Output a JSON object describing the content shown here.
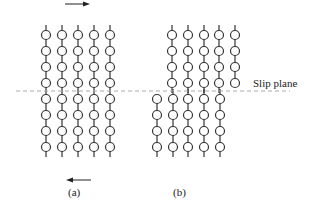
{
  "diagram": {
    "type": "slip-plane-atom-lattice",
    "slip_plane_label": "Slip plane",
    "panels": [
      {
        "id": "a",
        "caption": "(a)",
        "columns_x": [
          46,
          62,
          78,
          94,
          110
        ],
        "rows_y": [
          35,
          51,
          67,
          83,
          99,
          115,
          131,
          147
        ],
        "arrows": [
          {
            "direction": "right",
            "position": "top"
          },
          {
            "direction": "left",
            "position": "bottom"
          }
        ]
      },
      {
        "id": "b",
        "caption": "(b)",
        "upper_half": {
          "columns_x": [
            172,
            188,
            204,
            219,
            235
          ],
          "rows_y": [
            35,
            51,
            67,
            83
          ]
        },
        "lower_half": {
          "columns_x": [
            157,
            173,
            188,
            204,
            220
          ],
          "rows_y": [
            99,
            115,
            131,
            147
          ]
        }
      }
    ],
    "colors": {
      "atom_stroke": "#333333",
      "bond": "#333333",
      "slip_plane": "#aaaaaa",
      "background": "#ffffff"
    }
  }
}
